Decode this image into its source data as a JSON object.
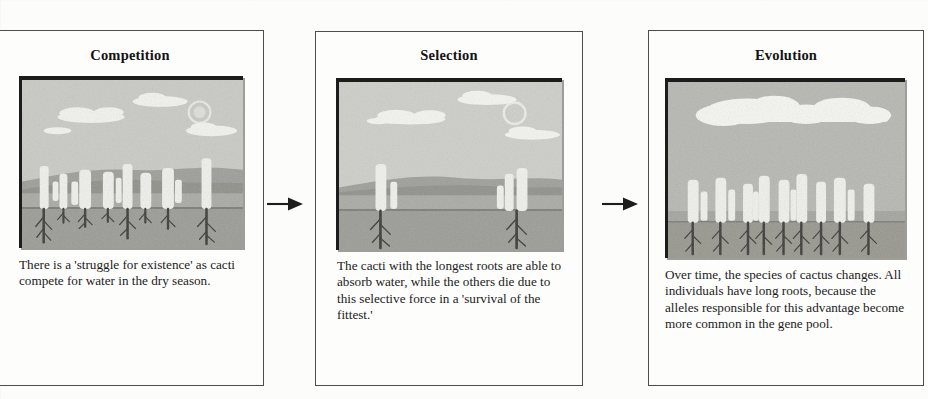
{
  "figure": {
    "title_sequence": [
      "Competition",
      "Selection",
      "Evolution"
    ],
    "arrow_icon": "arrow-right-icon"
  },
  "panels": [
    {
      "id": "competition",
      "heading": "Competition",
      "caption": "There is a 'struggle for existence' as cacti compete for water in the dry season.",
      "illustration": {
        "name": "desert-cacti-many-varied-roots",
        "scene": "desert with sun, clouds, hills, many cacti above ground and roots of varied length below ground",
        "cacti_count": 8,
        "sun": true,
        "clouds": 4
      }
    },
    {
      "id": "selection",
      "heading": "Selection",
      "caption": "The cacti with the longest roots are able to absorb water, while the others die due to this selective force in a 'survival of the fittest.'",
      "illustration": {
        "name": "desert-two-surviving-cacti-long-roots",
        "scene": "desert with sun, clouds, hills, only two cacti groups remaining, each with long roots",
        "cacti_count": 2,
        "sun": true,
        "clouds": 4
      }
    },
    {
      "id": "evolution",
      "heading": "Evolution",
      "caption": "Over time, the species of cactus changes. All individuals have long roots, because the alleles responsible for this advantage become more common in the gene pool.",
      "illustration": {
        "name": "desert-population-all-long-roots",
        "scene": "desert with large cloud bank, dense population of cacti all with long roots",
        "cacti_count": 9,
        "sun": false,
        "clouds": 1
      }
    }
  ],
  "colors": {
    "ink": "#131313",
    "frame": "#4d4d4d",
    "paper": "#fdfdfc",
    "sky": "#c9c9c5",
    "ground": "#a8a8a3",
    "subsoil": "#9a9a95",
    "cactus": "#eeeeea",
    "root": "#3c3c3a",
    "cloud": "#f4f4f1",
    "hill": "#8e8e8a"
  }
}
